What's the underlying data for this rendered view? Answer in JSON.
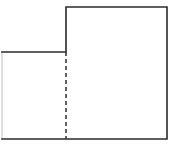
{
  "figure": {
    "name": "l-shaped-composite-figure",
    "type": "geometric-diagram",
    "description": "L-shaped (step) polygon outlined in dark gray with an interior vertical dashed partition line dividing it into two rectangles",
    "canvas": {
      "width": 173,
      "height": 147,
      "background_color": "#ffffff"
    },
    "style": {
      "outline_color": "#2b2b2b",
      "outline_width": 1.6,
      "left_edge_color": "#c9c9c9",
      "left_edge_width": 1.2,
      "dashed_color": "#3a3a3a",
      "dashed_width": 1.6,
      "dash_pattern": "4 3",
      "fill_color": "none"
    },
    "vertices": [
      {
        "label": "A",
        "x": 2,
        "y": 52
      },
      {
        "label": "B",
        "x": 66,
        "y": 52
      },
      {
        "label": "C",
        "x": 66,
        "y": 7
      },
      {
        "label": "D",
        "x": 167,
        "y": 7
      },
      {
        "label": "E",
        "x": 167,
        "y": 139
      },
      {
        "label": "F",
        "x": 2,
        "y": 139
      }
    ],
    "outline_path": "M 2 52 L 66 52 L 66 7 L 167 7 L 167 139 L 2 139",
    "left_edge_path": "M 2 52 L 2 139",
    "partition_line": {
      "name": "dashed-partition",
      "orientation": "vertical",
      "x": 66,
      "y_start": 52,
      "y_end": 139
    },
    "edges": [
      {
        "name": "ledge-top-left",
        "from": "A",
        "to": "B",
        "orientation": "horizontal"
      },
      {
        "name": "step-riser",
        "from": "B",
        "to": "C",
        "orientation": "vertical"
      },
      {
        "name": "top-edge",
        "from": "C",
        "to": "D",
        "orientation": "horizontal"
      },
      {
        "name": "right-edge",
        "from": "D",
        "to": "E",
        "orientation": "vertical"
      },
      {
        "name": "bottom-edge",
        "from": "E",
        "to": "F",
        "orientation": "horizontal"
      },
      {
        "name": "left-edge",
        "from": "F",
        "to": "A",
        "orientation": "vertical"
      }
    ],
    "labels": []
  }
}
